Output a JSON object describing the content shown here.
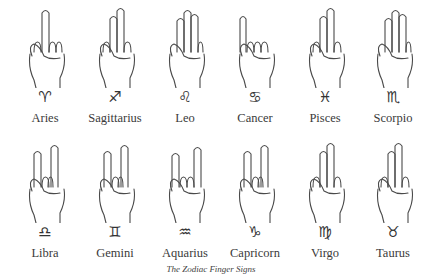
{
  "rows": [
    [
      {
        "name": "Aries",
        "symbol": "♈︎",
        "gesture": "index-up"
      },
      {
        "name": "Sagittarius",
        "symbol": "♐︎",
        "gesture": "index-middle-up"
      },
      {
        "name": "Leo",
        "symbol": "♌︎",
        "gesture": "three-up"
      },
      {
        "name": "Cancer",
        "symbol": "♋︎",
        "gesture": "pinky-up"
      },
      {
        "name": "Pisces",
        "symbol": "♓︎",
        "gesture": "index-middle-up"
      },
      {
        "name": "Scorpio",
        "symbol": "♏︎",
        "gesture": "three-up"
      }
    ],
    [
      {
        "name": "Libra",
        "symbol": "♎︎",
        "gesture": "v-sign"
      },
      {
        "name": "Gemini",
        "symbol": "♊︎",
        "gesture": "v-sign"
      },
      {
        "name": "Aquarius",
        "symbol": "♒︎",
        "gesture": "horns"
      },
      {
        "name": "Capricorn",
        "symbol": "♑︎",
        "gesture": "v-sign"
      },
      {
        "name": "Virgo",
        "symbol": "♍︎",
        "gesture": "index-middle-up"
      },
      {
        "name": "Taurus",
        "symbol": "♉︎",
        "gesture": "index-middle-up"
      }
    ]
  ],
  "caption": "The Zodiac Finger Signs",
  "colors": {
    "line": "#4a4a4a",
    "background": "#ffffff"
  }
}
